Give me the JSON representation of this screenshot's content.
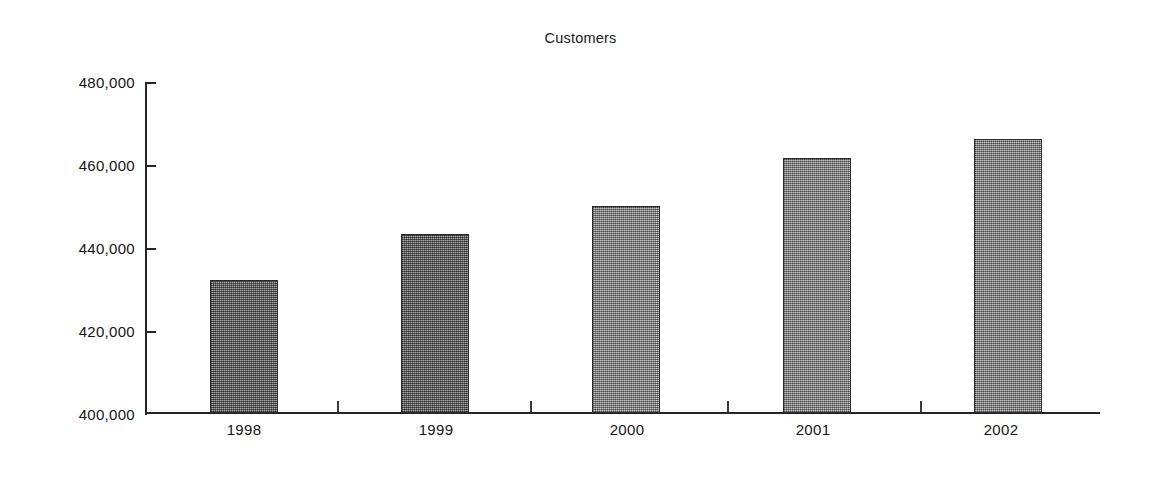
{
  "chart_data": {
    "type": "bar",
    "title": "Customers",
    "xlabel": "",
    "ylabel": "",
    "categories": [
      "1998",
      "1999",
      "2000",
      "2001",
      "2002"
    ],
    "values": [
      432000,
      443200,
      450000,
      461500,
      466000
    ],
    "ylim": [
      400000,
      480000
    ],
    "yticks": [
      400000,
      420000,
      440000,
      460000,
      480000
    ],
    "ytick_labels": [
      "400,000",
      "420,000",
      "440,000",
      "460,000",
      "480,000"
    ],
    "grid": false,
    "legend": null,
    "series": [
      {
        "name": "Customers",
        "values": [
          432000,
          443200,
          450000,
          461500,
          466000
        ]
      }
    ],
    "bar_fill_color": "#8a8a8a",
    "bar_border_color": "#2b2b2b",
    "axis_color": "#262626",
    "background_color": "#ffffff"
  },
  "figure": {
    "title": "Customers"
  }
}
